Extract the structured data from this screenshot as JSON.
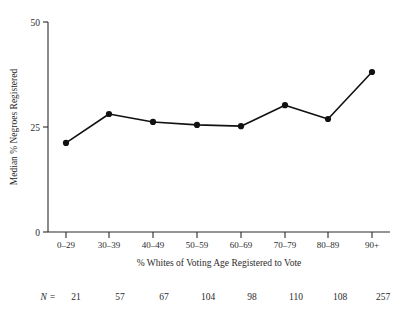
{
  "chart_data": {
    "type": "line",
    "title": "",
    "subtitle": "",
    "xlabel": "% Whites of Voting Age Registered to Vote",
    "ylabel": "Median % Negroes Registered",
    "categories": [
      "0–29",
      "30–39",
      "40–49",
      "50–59",
      "60–69",
      "70–79",
      "80–89",
      "90+"
    ],
    "values": [
      21.2,
      28.1,
      26.2,
      25.5,
      25.2,
      30.2,
      26.9,
      38.1
    ],
    "series": [
      {
        "name": "Median % Negroes Registered",
        "values": [
          21.2,
          28.1,
          26.2,
          25.5,
          25.2,
          30.2,
          26.9,
          38.1
        ]
      }
    ],
    "yticks": [
      0,
      25,
      50
    ],
    "ytick_labels": [
      "0",
      "25",
      "50"
    ],
    "ylim": [
      0,
      50
    ],
    "grid": false,
    "legend": false,
    "legend_position": "none",
    "marker": "filled-circle",
    "line_color": "#111111",
    "marker_color": "#111111",
    "axis_color": "#2b2b2b",
    "background_color": "#ffffff"
  },
  "footer": {
    "n_label": "N =",
    "n_values": [
      "21",
      "57",
      "67",
      "104",
      "98",
      "110",
      "108",
      "257"
    ]
  }
}
